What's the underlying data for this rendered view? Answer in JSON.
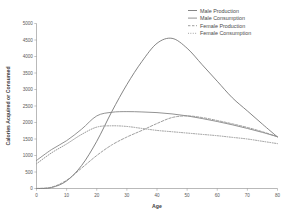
{
  "chart_data": {
    "type": "line",
    "title": "",
    "xlabel": "Age",
    "ylabel": "Calories Acquired or Consumed",
    "xlim": [
      0,
      80
    ],
    "ylim": [
      0,
      5000
    ],
    "grid": false,
    "legend_position": "top-right",
    "x_ticks": [
      "0",
      "10",
      "20",
      "30",
      "40",
      "50",
      "60",
      "70",
      "80"
    ],
    "y_ticks": [
      "0",
      "500",
      "1000",
      "1500",
      "2000",
      "2500",
      "3000",
      "3500",
      "4000",
      "4500",
      "5000"
    ],
    "x": [
      0,
      5,
      10,
      15,
      20,
      25,
      30,
      35,
      40,
      45,
      50,
      55,
      60,
      65,
      70,
      75,
      80
    ],
    "series": [
      {
        "name": "Male Production",
        "style": "solid",
        "color": "#6f6f6f",
        "values": [
          0,
          30,
          230,
          700,
          1430,
          2330,
          3150,
          3850,
          4400,
          4550,
          4250,
          3750,
          3250,
          2750,
          2350,
          1950,
          1560
        ]
      },
      {
        "name": "Male Consumption",
        "style": "solid",
        "color": "#808080",
        "values": [
          850,
          1180,
          1450,
          1800,
          2200,
          2310,
          2330,
          2320,
          2300,
          2260,
          2200,
          2120,
          2030,
          1930,
          1820,
          1700,
          1570
        ]
      },
      {
        "name": "Female Production",
        "style": "dashed",
        "color": "#8d8d8d",
        "values": [
          0,
          40,
          250,
          620,
          1000,
          1320,
          1560,
          1760,
          1970,
          2150,
          2200,
          2150,
          2060,
          1960,
          1850,
          1720,
          1570
        ]
      },
      {
        "name": "Female Consumption",
        "style": "dotted",
        "color": "#999999",
        "values": [
          750,
          1080,
          1350,
          1640,
          1860,
          1900,
          1880,
          1820,
          1760,
          1720,
          1680,
          1640,
          1600,
          1550,
          1500,
          1430,
          1360
        ]
      }
    ],
    "legend_entries": [
      "Male Production",
      "Male Consumption",
      "Female Production",
      "Female Consumption"
    ]
  }
}
